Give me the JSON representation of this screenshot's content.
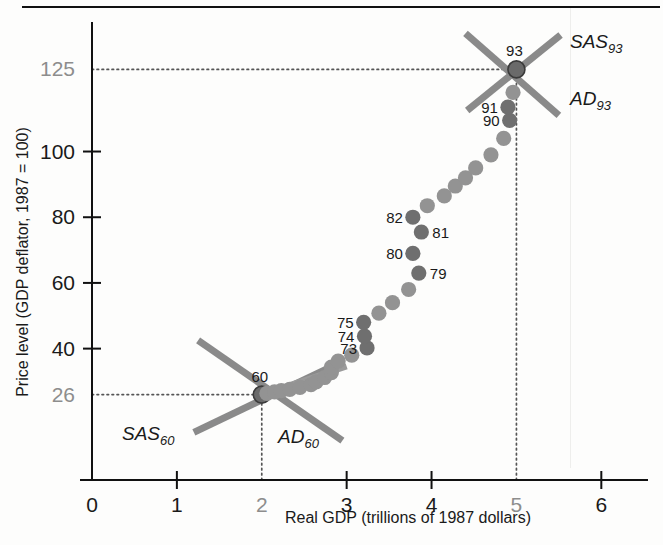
{
  "figure": {
    "name": "as-ad-historical-scatter",
    "top_rule": true
  },
  "axes": {
    "y": {
      "title": "Price level (GDP deflator, 1987 = 100)",
      "ticks": [
        {
          "value": 26,
          "label": "26",
          "muted": true,
          "has_tickmark": false
        },
        {
          "value": 40,
          "label": "40",
          "muted": false,
          "has_tickmark": true
        },
        {
          "value": 60,
          "label": "60",
          "muted": false,
          "has_tickmark": true
        },
        {
          "value": 80,
          "label": "80",
          "muted": false,
          "has_tickmark": true
        },
        {
          "value": 100,
          "label": "100",
          "muted": false,
          "has_tickmark": true
        },
        {
          "value": 125,
          "label": "125",
          "muted": true,
          "has_tickmark": false
        }
      ],
      "range": [
        0,
        137
      ]
    },
    "x": {
      "title": "Real GDP (trillions of 1987 dollars)",
      "ticks": [
        {
          "value": 0,
          "label": "0",
          "muted": false,
          "has_tickmark": false
        },
        {
          "value": 1,
          "label": "1",
          "muted": false,
          "has_tickmark": true
        },
        {
          "value": 2,
          "label": "2",
          "muted": true,
          "has_tickmark": false
        },
        {
          "value": 3,
          "label": "3",
          "muted": false,
          "has_tickmark": true
        },
        {
          "value": 4,
          "label": "4",
          "muted": false,
          "has_tickmark": true
        },
        {
          "value": 5,
          "label": "5",
          "muted": true,
          "has_tickmark": false
        },
        {
          "value": 6,
          "label": "6",
          "muted": false,
          "has_tickmark": true
        }
      ],
      "range": [
        0,
        6.55
      ]
    }
  },
  "chart_data": {
    "type": "scatter",
    "title": "",
    "xlabel": "Real GDP (trillions of 1987 dollars)",
    "ylabel": "Price level (GDP deflator, 1987 = 100)",
    "xlim": [
      0,
      6.55
    ],
    "ylim": [
      0,
      137
    ],
    "grid": false,
    "legend": "none",
    "series": [
      {
        "name": "Price level and real GDP, 1960-1993",
        "points": [
          {
            "year": "60",
            "x": 2.0,
            "y": 26.0,
            "label": "60",
            "marker": "equilibrium"
          },
          {
            "year": "61",
            "x": 2.06,
            "y": 26.4,
            "label": null,
            "marker": "dot"
          },
          {
            "year": "62",
            "x": 2.15,
            "y": 26.8,
            "label": null,
            "marker": "dot"
          },
          {
            "year": "63",
            "x": 2.23,
            "y": 27.2,
            "label": null,
            "marker": "dot"
          },
          {
            "year": "64",
            "x": 2.33,
            "y": 27.6,
            "label": null,
            "marker": "dot"
          },
          {
            "year": "65",
            "x": 2.45,
            "y": 28.2,
            "label": null,
            "marker": "dot"
          },
          {
            "year": "66",
            "x": 2.58,
            "y": 29.0,
            "label": null,
            "marker": "dot"
          },
          {
            "year": "67",
            "x": 2.64,
            "y": 29.9,
            "label": null,
            "marker": "dot"
          },
          {
            "year": "68",
            "x": 2.74,
            "y": 31.2,
            "label": null,
            "marker": "dot"
          },
          {
            "year": "69",
            "x": 2.82,
            "y": 32.7,
            "label": null,
            "marker": "dot"
          },
          {
            "year": "70",
            "x": 2.82,
            "y": 34.4,
            "label": null,
            "marker": "dot"
          },
          {
            "year": "71",
            "x": 2.9,
            "y": 36.2,
            "label": null,
            "marker": "dot"
          },
          {
            "year": "72",
            "x": 3.06,
            "y": 38.0,
            "label": null,
            "marker": "dot"
          },
          {
            "year": "73",
            "x": 3.24,
            "y": 40.2,
            "label": "73",
            "marker": "dot-dark"
          },
          {
            "year": "74",
            "x": 3.21,
            "y": 43.8,
            "label": "74",
            "marker": "dot-dark"
          },
          {
            "year": "75",
            "x": 3.2,
            "y": 48.0,
            "label": "75",
            "marker": "dot-dark"
          },
          {
            "year": "76",
            "x": 3.38,
            "y": 50.8,
            "label": null,
            "marker": "dot"
          },
          {
            "year": "77",
            "x": 3.54,
            "y": 54.0,
            "label": null,
            "marker": "dot"
          },
          {
            "year": "78",
            "x": 3.73,
            "y": 58.0,
            "label": null,
            "marker": "dot"
          },
          {
            "year": "79",
            "x": 3.85,
            "y": 63.0,
            "label": "79",
            "marker": "dot-dark"
          },
          {
            "year": "80",
            "x": 3.78,
            "y": 69.0,
            "label": "80",
            "marker": "dot-dark"
          },
          {
            "year": "81",
            "x": 3.88,
            "y": 75.5,
            "label": "81",
            "marker": "dot-dark"
          },
          {
            "year": "82",
            "x": 3.78,
            "y": 80.0,
            "label": "82",
            "marker": "dot-dark"
          },
          {
            "year": "83",
            "x": 3.95,
            "y": 83.5,
            "label": null,
            "marker": "dot"
          },
          {
            "year": "84",
            "x": 4.15,
            "y": 86.5,
            "label": null,
            "marker": "dot"
          },
          {
            "year": "85",
            "x": 4.28,
            "y": 89.5,
            "label": null,
            "marker": "dot"
          },
          {
            "year": "86",
            "x": 4.4,
            "y": 92.0,
            "label": null,
            "marker": "dot"
          },
          {
            "year": "87",
            "x": 4.52,
            "y": 95.0,
            "label": null,
            "marker": "dot"
          },
          {
            "year": "88",
            "x": 4.7,
            "y": 99.0,
            "label": null,
            "marker": "dot"
          },
          {
            "year": "89",
            "x": 4.85,
            "y": 104.0,
            "label": null,
            "marker": "dot"
          },
          {
            "year": "90",
            "x": 4.92,
            "y": 109.5,
            "label": "90",
            "marker": "dot-dark"
          },
          {
            "year": "91",
            "x": 4.9,
            "y": 113.5,
            "label": "91",
            "marker": "dot-dark"
          },
          {
            "year": "92",
            "x": 4.96,
            "y": 118.0,
            "label": null,
            "marker": "dot"
          },
          {
            "year": "93",
            "x": 5.0,
            "y": 125.0,
            "label": "93",
            "marker": "equilibrium"
          }
        ]
      }
    ],
    "annotations": [
      {
        "name": "sas-1960",
        "text": "SAS",
        "subscript": "60",
        "type": "curve",
        "x1": 1.25,
        "y1": 42.5,
        "x2": 2.95,
        "y2": 12.0
      },
      {
        "name": "ad-1960",
        "text": "AD",
        "subscript": "60",
        "type": "curve",
        "x1": 1.2,
        "y1": 14.5,
        "x2": 2.86,
        "y2": 35.0
      },
      {
        "name": "sas-1993",
        "text": "SAS",
        "subscript": "93",
        "type": "curve",
        "x1": 4.42,
        "y1": 112.5,
        "x2": 5.52,
        "y2": 135.5
      },
      {
        "name": "ad-1993",
        "text": "AD",
        "subscript": "93",
        "type": "curve",
        "x1": 4.4,
        "y1": 136.0,
        "x2": 5.5,
        "y2": 111.0
      },
      {
        "name": "trend-stub",
        "text": "",
        "subscript": "",
        "type": "segment",
        "x1": 2.28,
        "y1": 28.4,
        "x2": 3.0,
        "y2": 34.6
      }
    ],
    "reference_lines": [
      {
        "name": "price-26",
        "axis": "y",
        "value": 26,
        "from": 0.0,
        "to": 2.0
      },
      {
        "name": "price-125",
        "axis": "y",
        "value": 125,
        "from": 0.0,
        "to": 5.0
      },
      {
        "name": "gdp-2",
        "axis": "x",
        "value": 2.0,
        "from": 0.0,
        "to": 26.0
      },
      {
        "name": "gdp-5",
        "axis": "x",
        "value": 5.0,
        "from": 0.0,
        "to": 125.0
      }
    ]
  },
  "colors": {
    "dot": "#939393",
    "dot_dark": "#6f6f6f",
    "equilibrium": "#6a6a6a",
    "curve": "#8a8a8a",
    "axis": "#111111",
    "dotted": "#555555",
    "muted_label": "#8d8d8d"
  }
}
